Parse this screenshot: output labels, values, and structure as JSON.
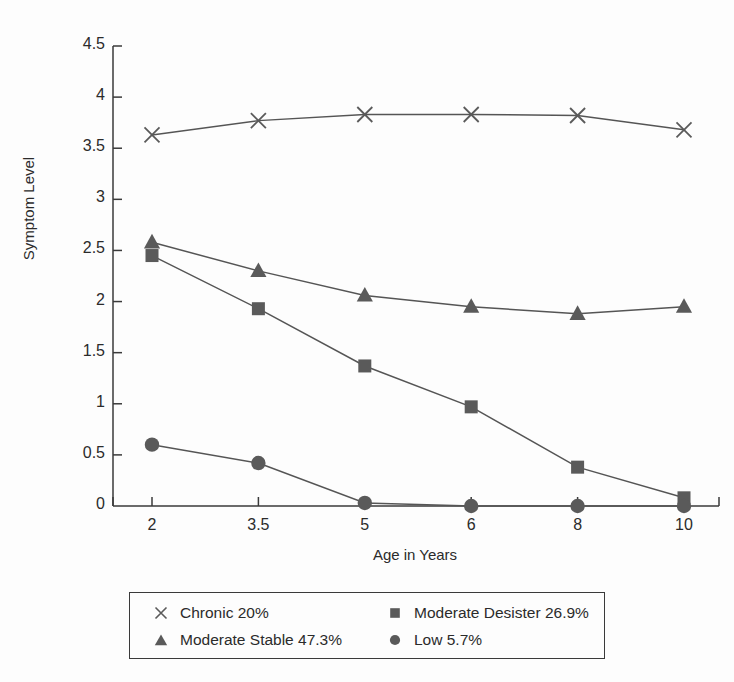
{
  "chart_data": {
    "type": "line",
    "title": "",
    "xlabel": "Age in Years",
    "ylabel": "Symptom Level",
    "categories": [
      "2",
      "3.5",
      "5",
      "6",
      "8",
      "10"
    ],
    "x": [
      2,
      3.5,
      5,
      6,
      8,
      10
    ],
    "ylim": [
      0,
      4.5
    ],
    "yticks": [
      "0",
      "0.5",
      "1",
      "1.5",
      "2",
      "2.5",
      "3",
      "3.5",
      "4",
      "4.5"
    ],
    "ytick_values": [
      0,
      0.5,
      1,
      1.5,
      2,
      2.5,
      3,
      3.5,
      4,
      4.5
    ],
    "grid": false,
    "legend_position": "bottom",
    "series": [
      {
        "name": "Chronic 20%",
        "marker": "x",
        "color": "#555555",
        "values": [
          3.63,
          3.77,
          3.83,
          3.83,
          3.82,
          3.68
        ]
      },
      {
        "name": "Moderate Desister 26.9%",
        "marker": "square",
        "color": "#555555",
        "values": [
          2.45,
          1.93,
          1.37,
          0.97,
          0.38,
          0.08
        ]
      },
      {
        "name": "Moderate Stable 47.3%",
        "marker": "triangle",
        "color": "#555555",
        "values": [
          2.58,
          2.3,
          2.06,
          1.95,
          1.88,
          1.95
        ]
      },
      {
        "name": "Low 5.7%",
        "marker": "circle",
        "color": "#555555",
        "values": [
          0.6,
          0.42,
          0.03,
          0.0,
          0.0,
          0.0
        ]
      }
    ]
  },
  "legend": {
    "entries": [
      {
        "label": "Chronic 20%",
        "marker": "x-marker-icon"
      },
      {
        "label": "Moderate Stable 47.3%",
        "marker": "triangle-marker-icon"
      },
      {
        "label": "Moderate Desister 26.9%",
        "marker": "square-marker-icon"
      },
      {
        "label": "Low 5.7%",
        "marker": "circle-marker-icon"
      }
    ]
  },
  "axes": {
    "x_title": "Age in Years",
    "y_title": "Symptom Level",
    "x_ticks": [
      "2",
      "3.5",
      "5",
      "6",
      "8",
      "10"
    ],
    "y_ticks": [
      "4.5",
      "4",
      "3.5",
      "3",
      "2.5",
      "2",
      "1.5",
      "1",
      "0.5",
      "0"
    ]
  },
  "style": {
    "axis_color": "#3a3a3a",
    "line_color": "#555555",
    "marker_color": "#5a5a5a",
    "text_color": "#2b2b2b",
    "background": "#fdfdfd"
  }
}
